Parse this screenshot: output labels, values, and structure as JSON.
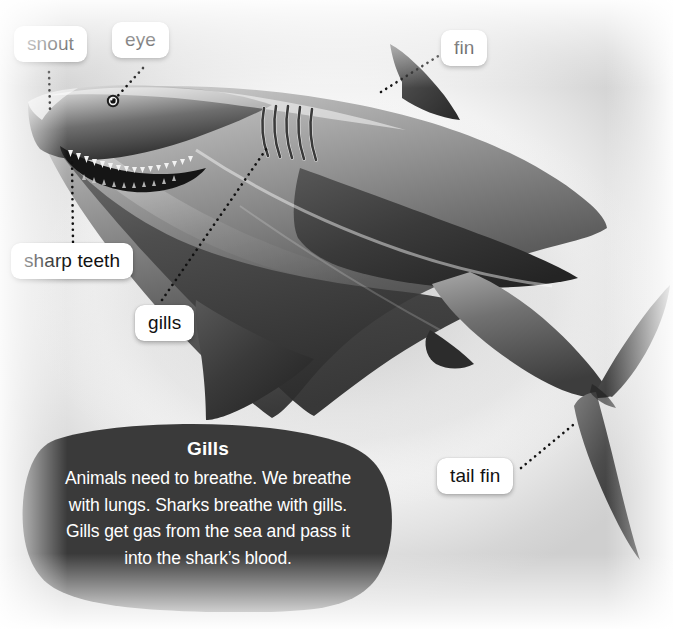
{
  "diagram": {
    "subject": "shark",
    "title_text": "",
    "background_color": "#f0f0f0",
    "label_chip_color": "#ffffff",
    "label_text_color": "#111111",
    "leader_line_color": "#111111",
    "leader_line_style": "dotted"
  },
  "labels": [
    {
      "id": "snout",
      "text": "snout",
      "x": 14,
      "y": 26,
      "points_to": "tip of the shark nose"
    },
    {
      "id": "eye",
      "text": "eye",
      "x": 112,
      "y": 22,
      "points_to": "shark eye"
    },
    {
      "id": "fin",
      "text": "fin",
      "x": 441,
      "y": 30,
      "points_to": "dorsal fin"
    },
    {
      "id": "sharp-teeth",
      "text": "sharp teeth",
      "x": 11,
      "y": 243,
      "points_to": "teeth in open jaw"
    },
    {
      "id": "gills",
      "text": "gills",
      "x": 135,
      "y": 305,
      "points_to": "gill slits"
    },
    {
      "id": "tail-fin",
      "text": "tail fin",
      "x": 437,
      "y": 458,
      "points_to": "caudal tail fin"
    }
  ],
  "info_box": {
    "title": "Gills",
    "background_color": "#3a3a3a",
    "text_color": "#ffffff",
    "lines": [
      "Animals need to breathe. We breathe",
      "with lungs. Sharks breathe with gills.",
      "Gills get gas from the sea and pass it",
      "into the shark’s blood."
    ],
    "paragraph": "Animals need to breathe. We breathe with lungs. Sharks breathe with gills. Gills get gas from the sea and pass it into the shark’s blood."
  }
}
